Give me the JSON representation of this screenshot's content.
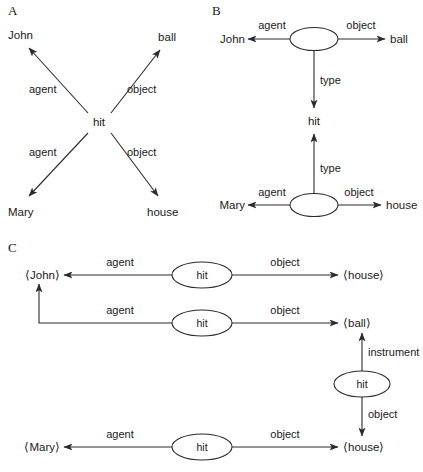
{
  "figure": {
    "background_color": "#ffffff",
    "stroke_color": "#2b2b2b",
    "text_color": "#1a1a1a"
  },
  "panels": [
    {
      "id": "A",
      "label": "A",
      "center_node": "hit",
      "terms": {
        "top_left": "John",
        "top_right": "ball",
        "bottom_left": "Mary",
        "bottom_right": "house"
      },
      "relations": {
        "top_left": "agent",
        "top_right": "object",
        "bottom_left": "agent",
        "bottom_right": "object"
      }
    },
    {
      "id": "B",
      "label": "B",
      "type_node": "hit",
      "upper": {
        "node": "",
        "left_term": "John",
        "right_term": "ball",
        "left_relation": "agent",
        "right_relation": "object",
        "type_relation": "type"
      },
      "lower": {
        "node": "",
        "left_term": "Mary",
        "right_term": "house",
        "left_relation": "agent",
        "right_relation": "object",
        "type_relation": "type"
      }
    },
    {
      "id": "C",
      "label": "C",
      "rows": [
        {
          "node": "hit",
          "left_term": "⟨John⟩",
          "right_term": "⟨house⟩",
          "left_relation": "agent",
          "right_relation": "object"
        },
        {
          "node": "hit",
          "left_term": "⟨John⟩",
          "right_term": "⟨ball⟩",
          "left_relation": "agent",
          "right_relation": "object"
        },
        {
          "node": "hit",
          "left_term": "",
          "right_term": "⟨ball⟩",
          "left_relation": "",
          "right_relation": "object",
          "up_relation": "instrument"
        },
        {
          "node": "hit",
          "left_term": "⟨Mary⟩",
          "right_term": "⟨house⟩",
          "left_relation": "agent",
          "right_relation": "object"
        }
      ],
      "instrument_relation": "instrument",
      "instrument_object_relation": "object",
      "instrument_target": "⟨house⟩"
    }
  ]
}
